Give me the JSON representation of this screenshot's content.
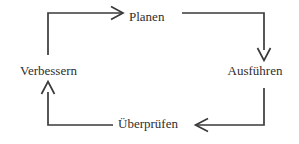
{
  "diagram": {
    "type": "cycle",
    "background_color": "#ffffff",
    "line_color": "#3a3a3a",
    "text_color": "#2e2e2e",
    "nodes": [
      {
        "id": "planen",
        "label": "Planen"
      },
      {
        "id": "ausfuehren",
        "label": "Ausführen"
      },
      {
        "id": "ueberpruefen",
        "label": "Überprüfen"
      },
      {
        "id": "verbessern",
        "label": "Verbessern"
      }
    ],
    "arrows": [
      {
        "id": "verbessern-to-planen",
        "from": "verbessern",
        "to": "planen",
        "direction": "right"
      },
      {
        "id": "planen-to-ausfuehren",
        "from": "planen",
        "to": "ausfuehren",
        "direction": "down"
      },
      {
        "id": "ausfuehren-to-ueberpruefen",
        "from": "ausfuehren",
        "to": "ueberpruefen",
        "direction": "left"
      },
      {
        "id": "ueberpruefen-to-verbessern",
        "from": "ueberpruefen",
        "to": "verbessern",
        "direction": "up"
      }
    ]
  }
}
